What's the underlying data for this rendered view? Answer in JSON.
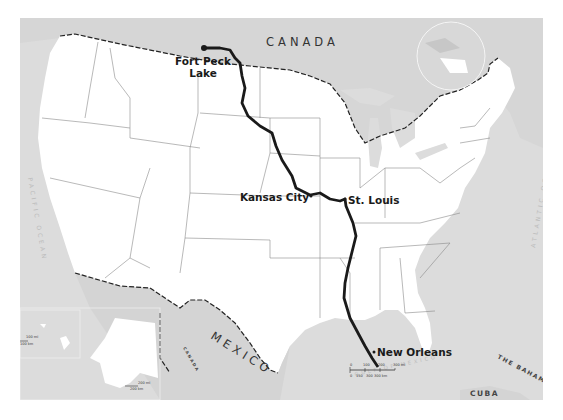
{
  "map": {
    "title": "Missouri River and Mississippi River route map",
    "colors": {
      "background": "#ffffff",
      "water": "#dcdcdc",
      "land_us": "#ffffff",
      "land_foreign": "#d9d9d9",
      "state_borders": "#777777",
      "international_border": "#222222",
      "river": "#1a1a1a"
    },
    "countries": [
      {
        "name": "CANADA"
      },
      {
        "name": "MEXICO"
      },
      {
        "name": "CUBA"
      },
      {
        "name": "THE BAHAMAS"
      }
    ],
    "inset_labels": {
      "canada_alaska": "CANADA"
    },
    "oceans": [
      {
        "name": "PACIFIC OCEAN"
      },
      {
        "name": "ATLANTIC OCEAN"
      },
      {
        "name": "GULF OF MEXICO"
      }
    ],
    "cities": [
      {
        "name": "Fort Peck",
        "name2": "Lake",
        "marker": "start-dot"
      },
      {
        "name": "Kansas City",
        "marker": "dot"
      },
      {
        "name": "St. Louis",
        "marker": "dot"
      },
      {
        "name": "New Orleans",
        "marker": "dot"
      }
    ],
    "scale_bar": {
      "mi_labels": [
        "0",
        "100",
        "200",
        "300 mi"
      ],
      "km_labels": [
        "0",
        "150",
        "300",
        "300 km"
      ]
    },
    "alaska_scale": {
      "mi": "200 mi",
      "km": "200 km"
    },
    "hawaii_scale": {
      "mi": "100 mi",
      "km": "100 km"
    },
    "locator_globe": "north-america-globe"
  }
}
